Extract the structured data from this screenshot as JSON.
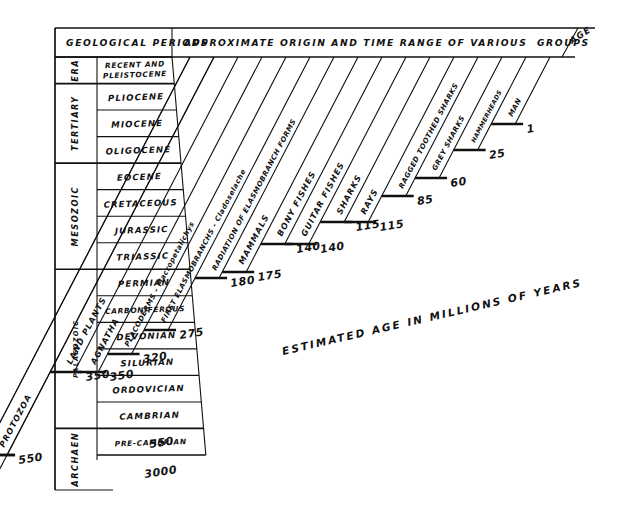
{
  "figure": {
    "headers": {
      "left": "GEOLOGICAL PERIODS",
      "right": "APPROXIMATE ORIGIN AND TIME RANGE OF VARIOUS  GROUPS",
      "age": "AGE"
    },
    "column_titles": {
      "era": "ERA"
    },
    "caption": "ESTIMATED AGE IN MILLIONS OF YEARS",
    "ink_color": "#111111",
    "paper_color": "#ffffff"
  },
  "eras": [
    {
      "label": "ERA",
      "rows": 1
    },
    {
      "label": "TERTIARY",
      "rows": 3
    },
    {
      "label": "MESOZOIC",
      "rows": 4
    },
    {
      "label": "PALAEOZOIC",
      "rows": 6
    },
    {
      "label": "ARCHAEN",
      "rows": 1
    }
  ],
  "periods": [
    "RECENT AND PLEISTOCENE",
    "PLIOCENE",
    "MIOCENE",
    "OLIGOCENE",
    "EOCENE",
    "CRETACEOUS",
    "JURASSIC",
    "TRIASSIC",
    "PERMIAN",
    "CARBONIFEROUS",
    "DEVONIAN",
    "SILURIAN",
    "ORDOVICIAN",
    "CAMBRIAN",
    "PRE-CAMBRIAN"
  ],
  "period_lines": {
    "recent": [
      "RECENT AND",
      "PLEISTOCENE"
    ]
  },
  "chart_data": {
    "type": "bar",
    "title": "APPROXIMATE ORIGIN AND TIME RANGE OF VARIOUS  GROUPS",
    "xlabel": "",
    "ylabel": "ESTIMATED AGE IN MILLIONS OF YEARS",
    "categories": [
      "PROTOZOA",
      "LAND PLANTS",
      "AGNATHA",
      "PLACODERMS - Macropetalichys",
      "FIRST ELASMOBRANCHS - Cladoselache",
      "RADIATION OF ELASMOBRANCH FORMS",
      "MAMMALS",
      "BONY FISHES",
      "GUITAR FISHES",
      "SHARKS",
      "RAYS",
      "RAGGED TOOTHED SHARKS",
      "GREY SHARKS",
      "HAMMERHEADS",
      "MAN"
    ],
    "values": [
      3000,
      350,
      350,
      320,
      275,
      180,
      175,
      140,
      140,
      115,
      115,
      85,
      60,
      25,
      1
    ],
    "value_labels": [
      "3000",
      "350",
      "350",
      "320",
      "275",
      "180",
      "175",
      "140",
      "140",
      "115",
      "115",
      "85",
      "60",
      "25",
      "1"
    ],
    "shown_age_labels": [
      "3000",
      "550",
      "350",
      "320",
      "275",
      "180",
      "175",
      "140",
      "115",
      "85",
      "60",
      "25",
      "1"
    ],
    "protozoa_extra_label": "550",
    "units": "millions of years",
    "grid": false,
    "legend": false
  },
  "groups": [
    {
      "name": "PROTOZOA",
      "age": "550",
      "size": "grp"
    },
    {
      "name": "LAND PLANTS",
      "age": "350",
      "size": "grp"
    },
    {
      "name": "AGNATHA",
      "age": "350",
      "size": "grp"
    },
    {
      "name": "PLACODERMS - Macropetalichys",
      "age": "320",
      "size": "grp-sm"
    },
    {
      "name": "FIRST ELASMOBRANCHS - Cladoselache",
      "age": "275",
      "size": "grp-sm"
    },
    {
      "name": "RADIATION OF ELASMOBRANCH FORMS",
      "age": "180",
      "size": "grp-sm"
    },
    {
      "name": "MAMMALS",
      "age": "175",
      "size": "grp"
    },
    {
      "name": "BONY FISHES",
      "age": "140",
      "size": "grp"
    },
    {
      "name": "GUITAR FISHES",
      "age": "140",
      "size": "grp"
    },
    {
      "name": "SHARKS",
      "age": "115",
      "size": "grp"
    },
    {
      "name": "RAYS",
      "age": "115",
      "size": "grp"
    },
    {
      "name": "RAGGED TOOTHED SHARKS",
      "age": "85",
      "size": "grp-sm"
    },
    {
      "name": "GREY SHARKS",
      "age": "60",
      "size": "grp-sm"
    },
    {
      "name": "HAMMERHEADS",
      "age": "25",
      "size": "grp-xs"
    },
    {
      "name": "MAN",
      "age": "1",
      "size": "grp-sm"
    }
  ],
  "age_numbers": [
    "3000",
    "550",
    "350",
    "320",
    "275",
    "180",
    "175",
    "140",
    "115",
    "85",
    "60",
    "25",
    "1"
  ]
}
